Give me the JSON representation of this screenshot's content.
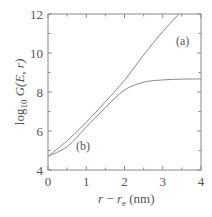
{
  "chart_data": {
    "type": "line",
    "title": "",
    "xlabel": "r − r_e (nm)",
    "ylabel": "log10 G(E, r)",
    "xlim": [
      0,
      4
    ],
    "ylim": [
      4,
      12
    ],
    "xticks": [
      0,
      1,
      2,
      3,
      4
    ],
    "yticks": [
      4,
      6,
      8,
      10,
      12
    ],
    "grid": false,
    "legend": "none (inline curve labels)",
    "series": [
      {
        "name": "(a)",
        "x": [
          0,
          0.5,
          1,
          1.5,
          2,
          2.5,
          3,
          3.42
        ],
        "y": [
          4.7,
          5.5,
          6.45,
          7.5,
          8.6,
          9.9,
          11.1,
          12.0
        ]
      },
      {
        "name": "(b)",
        "x": [
          0,
          0.5,
          1,
          1.5,
          2,
          2.5,
          3,
          3.5,
          4
        ],
        "y": [
          4.7,
          5.2,
          6.2,
          7.2,
          8.1,
          8.5,
          8.62,
          8.66,
          8.67
        ]
      }
    ],
    "annotations": [
      {
        "text": "(a)",
        "x": 3.4,
        "y": 11.0
      },
      {
        "text": "(b)",
        "x": 0.8,
        "y": 5.5
      }
    ]
  },
  "axes": {
    "x_tick_labels": [
      "0",
      "1",
      "2",
      "3",
      "4"
    ],
    "y_tick_labels": [
      "4",
      "6",
      "8",
      "10",
      "12"
    ],
    "x_title_parts": {
      "r": "r",
      "minus": " − ",
      "re": "r",
      "re_sub": "e",
      "unit": " (nm)"
    },
    "y_title_parts": {
      "log": "log",
      "sub": "10",
      "func": " G(E, r)"
    }
  },
  "labels": {
    "a": "(a)",
    "b": "(b)"
  },
  "colors": {
    "frame": "#8a8a8a",
    "curve": "#8a8a8a",
    "text": "#555555"
  }
}
